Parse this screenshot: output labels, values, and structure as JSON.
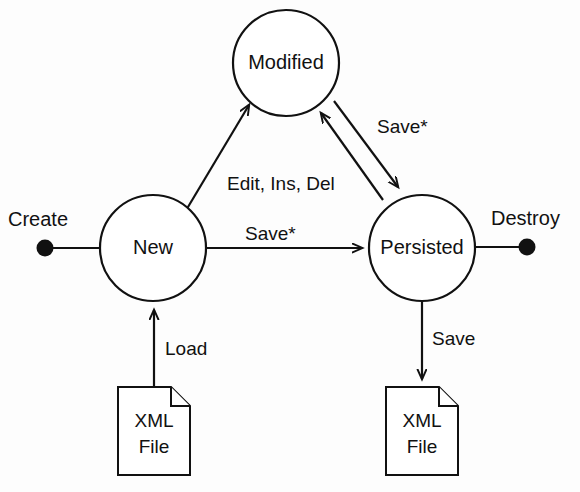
{
  "diagram": {
    "stroke_color": "#111111",
    "background_color": "#fdfdfd",
    "states": [
      {
        "id": "modified",
        "label": "Modified",
        "cx": 286,
        "cy": 63,
        "r": 53
      },
      {
        "id": "new",
        "label": "New",
        "cx": 153,
        "cy": 248,
        "r": 53
      },
      {
        "id": "persisted",
        "label": "Persisted",
        "cx": 422,
        "cy": 248,
        "r": 53
      }
    ],
    "terminals": [
      {
        "id": "create",
        "label": "Create",
        "cx": 45,
        "cy": 248,
        "r": 8,
        "label_x": 8,
        "label_y": 221
      },
      {
        "id": "destroy",
        "label": "Destroy",
        "cx": 527,
        "cy": 247,
        "r": 8,
        "label_x": 491,
        "label_y": 220
      }
    ],
    "edges": [
      {
        "id": "new-to-modified",
        "label": "Edit, Ins, Del",
        "label_x": 227,
        "label_y": 185
      },
      {
        "id": "new-to-persisted",
        "label": "Save*",
        "label_x": 245,
        "label_y": 235
      },
      {
        "id": "persisted-to-modified",
        "label": "",
        "label_x": 0,
        "label_y": 0
      },
      {
        "id": "modified-to-persisted",
        "label": "Save*",
        "label_x": 377,
        "label_y": 128
      },
      {
        "id": "xmlfile-to-new",
        "label": "Load",
        "label_x": 165,
        "label_y": 350
      },
      {
        "id": "persisted-to-xmlfile",
        "label": "Save",
        "label_x": 432,
        "label_y": 340
      }
    ],
    "artifacts": [
      {
        "id": "xml-file-source",
        "line1": "XML",
        "line2": "File",
        "x": 118,
        "y": 387,
        "w": 72,
        "h": 88,
        "fold": 19
      },
      {
        "id": "xml-file-target",
        "line1": "XML",
        "line2": "File",
        "x": 386,
        "y": 387,
        "w": 72,
        "h": 88,
        "fold": 19
      }
    ]
  }
}
